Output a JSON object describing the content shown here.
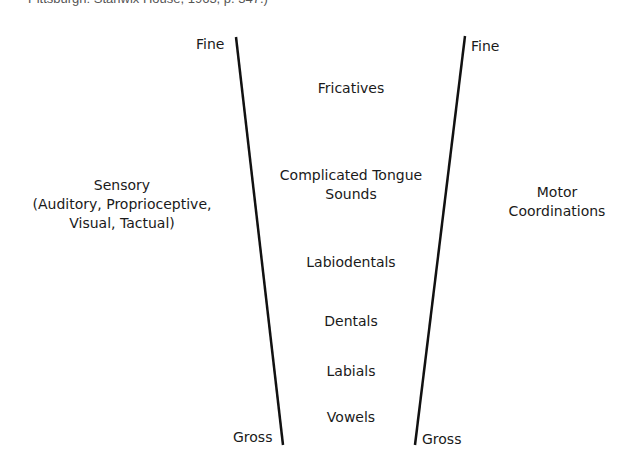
{
  "caption": "Pittsburgh: Stanwix House, 1963, p. 347.)",
  "diagram": {
    "left_axis": {
      "top_label": "Fine",
      "bottom_label": "Gross"
    },
    "right_axis": {
      "top_label": "Fine",
      "bottom_label": "Gross"
    },
    "left_side": {
      "line1": "Sensory",
      "line2": "(Auditory, Proprioceptive,",
      "line3": "Visual, Tactual)"
    },
    "right_side": {
      "line1": "Motor",
      "line2": "Coordinations"
    },
    "center_items": [
      {
        "line1": "Fricatives"
      },
      {
        "line1": "Complicated Tongue",
        "line2": "Sounds"
      },
      {
        "line1": "Labiodentals"
      },
      {
        "line1": "Dentals"
      },
      {
        "line1": "Labials"
      },
      {
        "line1": "Vowels"
      }
    ]
  },
  "colors": {
    "line": "#111111",
    "text": "#1a1a1a"
  }
}
